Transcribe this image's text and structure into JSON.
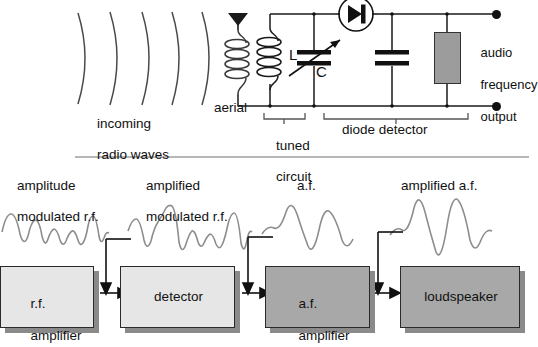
{
  "figure": {
    "accent_dark": "#a8a8a8",
    "accent_light": "#e6e6e6",
    "line_color": "#111111",
    "wave_color": "#8a8a8a"
  },
  "circuit": {
    "labels": {
      "incoming_line1": "incoming",
      "incoming_line2": "radio waves",
      "aerial": "aerial",
      "inductor": "L",
      "capacitor": "C",
      "output_line1": "audio",
      "output_line2": "frequency",
      "output_line3": "output",
      "tuned_line1": "tuned",
      "tuned_line2": "circuit",
      "diode_detector": "diode detector"
    },
    "components": {
      "antenna_icon": "antenna-triangle-icon",
      "aerial_coil_turns": 4,
      "inductor_turns": 4,
      "diode_icon": "diode-in-circle-icon",
      "variable_capacitor_icon": "variable-capacitor-icon",
      "capacitor_icon": "capacitor-icon",
      "resistor_icon": "resistor-block-icon",
      "radio_wave_arcs": 5,
      "terminal_dots": 2
    }
  },
  "block_diagram": {
    "signal_labels": [
      {
        "id": "amplitude-modulated-rf",
        "line1": "amplitude",
        "line2": "modulated r.f."
      },
      {
        "id": "amplified-modulated-rf",
        "line1": "amplified",
        "line2": "modulated r.f."
      },
      {
        "id": "af",
        "line1": "",
        "line2": "a.f."
      },
      {
        "id": "amplified-af",
        "line1": "",
        "line2": "amplified a.f."
      }
    ],
    "blocks": [
      {
        "id": "rf-amplifier",
        "line1": "r.f.",
        "line2": "amplifier",
        "shade": "light"
      },
      {
        "id": "detector",
        "line1": "detector",
        "line2": "",
        "shade": "light"
      },
      {
        "id": "af-amplifier",
        "line1": "a.f.",
        "line2": "amplifier",
        "shade": "dark"
      },
      {
        "id": "loudspeaker",
        "line1": "loudspeaker",
        "line2": "",
        "shade": "dark"
      }
    ],
    "waveforms": [
      {
        "id": "waveform-amplitude-modulated-rf",
        "type": "modulated-rf"
      },
      {
        "id": "waveform-amplified-modulated-rf",
        "type": "modulated-rf-amplified"
      },
      {
        "id": "waveform-af",
        "type": "audio-frequency"
      },
      {
        "id": "waveform-amplified-af",
        "type": "audio-frequency-amplified"
      }
    ],
    "arrows": 3
  }
}
